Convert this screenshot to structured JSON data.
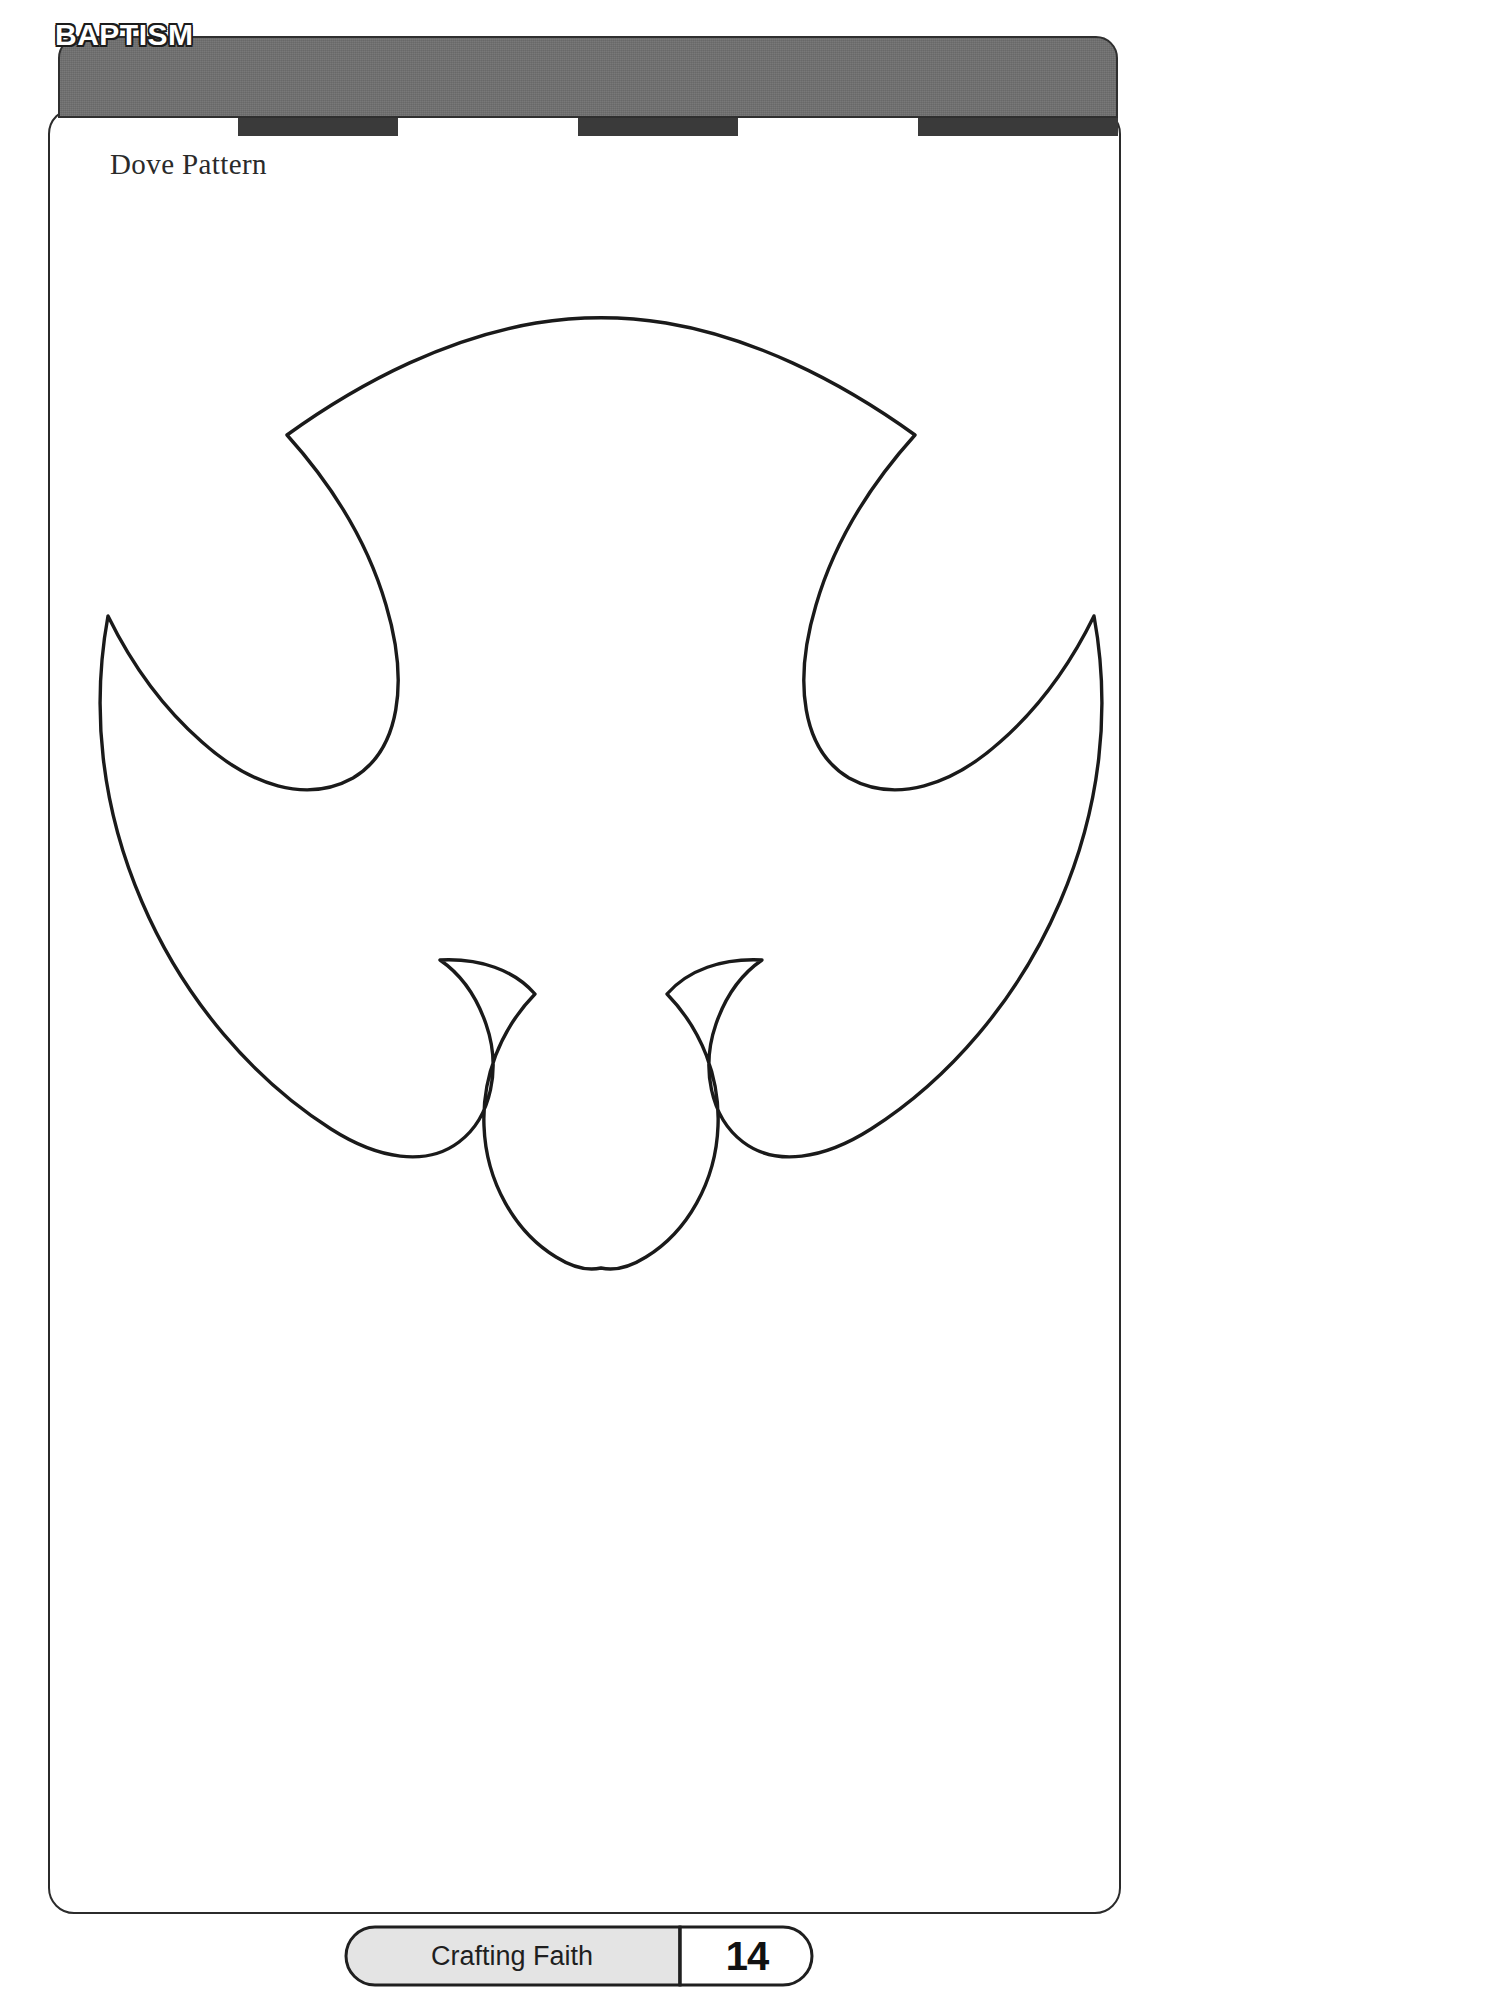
{
  "header": {
    "title": "BAPTISM",
    "subtitle": "People Collage",
    "bar_color": "#6f6f6f",
    "title_color": "#ffffff",
    "stripes": [
      {
        "kind": "light",
        "width": 180
      },
      {
        "kind": "dark",
        "width": 160
      },
      {
        "kind": "light",
        "width": 180
      },
      {
        "kind": "dark",
        "width": 160
      },
      {
        "kind": "light",
        "width": 180
      },
      {
        "kind": "dark",
        "width": 200
      }
    ]
  },
  "content": {
    "pattern_label": "Dove Pattern",
    "figure_name": "dove-outline",
    "figure_stroke": "#1a1a1a",
    "figure_fill": "#ffffff"
  },
  "footer": {
    "series_label": "Crafting Faith",
    "page_number": "14",
    "tab_fill": "#e4e4e4",
    "page_fill": "#ffffff"
  }
}
